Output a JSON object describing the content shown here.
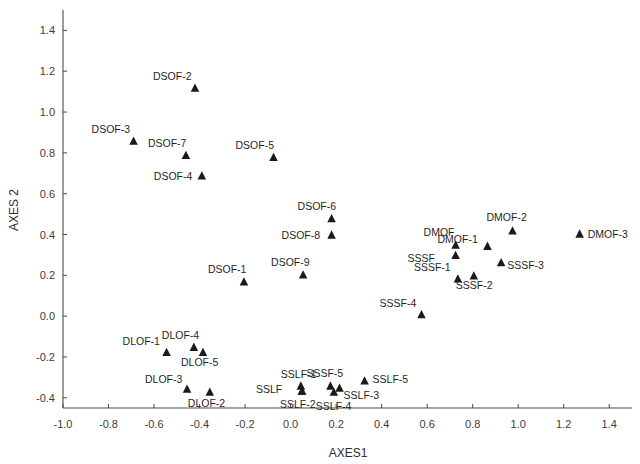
{
  "chart_data": {
    "type": "scatter",
    "title": "",
    "xlabel": "AXES1",
    "ylabel": "AXES 2",
    "xlim": [
      -1.0,
      1.5
    ],
    "ylim": [
      -0.45,
      1.5
    ],
    "grid": false,
    "legend": null,
    "marker": "triangle",
    "marker_color": "#1a1a1a",
    "xticks": [
      "-1.0",
      "-0.8",
      "-0.6",
      "-0.4",
      "-0.2",
      "0.0",
      "0.2",
      "0.4",
      "0.6",
      "0.8",
      "1.0",
      "1.2",
      "1.4"
    ],
    "xtick_values": [
      -1.0,
      -0.8,
      -0.6,
      -0.4,
      -0.2,
      0.0,
      0.2,
      0.4,
      0.6,
      0.8,
      1.0,
      1.2,
      1.4
    ],
    "yticks": [
      "-0.4",
      "-0.2",
      "0.0",
      "0.2",
      "0.4",
      "0.6",
      "0.8",
      "1.0",
      "1.2",
      "1.4"
    ],
    "ytick_values": [
      -0.4,
      -0.2,
      0.0,
      0.2,
      0.4,
      0.6,
      0.8,
      1.0,
      1.2,
      1.4
    ],
    "points": [
      {
        "label": "DSOF-2",
        "x": -0.42,
        "y": 1.115,
        "label_dx": -42,
        "label_dy": -9
      },
      {
        "label": "DSOF-3",
        "x": -0.69,
        "y": 0.855,
        "label_dx": -42,
        "label_dy": -9
      },
      {
        "label": "DSOF-7",
        "x": -0.46,
        "y": 0.785,
        "label_dx": -38,
        "label_dy": -9
      },
      {
        "label": "DSOF-5",
        "x": -0.075,
        "y": 0.775,
        "label_dx": -38,
        "label_dy": -9
      },
      {
        "label": "DSOF-4",
        "x": -0.39,
        "y": 0.685,
        "label_dx": -48,
        "label_dy": 4
      },
      {
        "label": "DSOF-6",
        "x": 0.18,
        "y": 0.475,
        "label_dx": -34,
        "label_dy": -9
      },
      {
        "label": "DSOF-8",
        "x": 0.18,
        "y": 0.395,
        "label_dx": -50,
        "label_dy": 3
      },
      {
        "label": "DSOF-9",
        "x": 0.055,
        "y": 0.2,
        "label_dx": -32,
        "label_dy": -9
      },
      {
        "label": "DSOF-1",
        "x": -0.205,
        "y": 0.165,
        "label_dx": -36,
        "label_dy": -9
      },
      {
        "label": "DMOF",
        "x": 0.725,
        "y": 0.345,
        "label_dx": -32,
        "label_dy": -10
      },
      {
        "label": "DMOF-1",
        "x": 0.865,
        "y": 0.34,
        "label_dx": -50,
        "label_dy": -4
      },
      {
        "label": "DMOF-2",
        "x": 0.975,
        "y": 0.415,
        "label_dx": -26,
        "label_dy": -10
      },
      {
        "label": "DMOF-3",
        "x": 1.27,
        "y": 0.4,
        "label_dx": 8,
        "label_dy": 3
      },
      {
        "label": "SSSF",
        "x": 0.725,
        "y": 0.295,
        "label_dx": -48,
        "label_dy": 6
      },
      {
        "label": "SSSF-3",
        "x": 0.925,
        "y": 0.26,
        "label_dx": 6,
        "label_dy": 6
      },
      {
        "label": "SSSF-1",
        "x": 0.735,
        "y": 0.18,
        "label_dx": -44,
        "label_dy": -8
      },
      {
        "label": "SSSF-2",
        "x": 0.805,
        "y": 0.195,
        "label_dx": -18,
        "label_dy": 13
      },
      {
        "label": "SSSF-4",
        "x": 0.575,
        "y": 0.005,
        "label_dx": -42,
        "label_dy": -8
      },
      {
        "label": "DLOF-4",
        "x": -0.425,
        "y": -0.155,
        "label_dx": -32,
        "label_dy": -9
      },
      {
        "label": "DLOF-1",
        "x": -0.545,
        "y": -0.18,
        "label_dx": -44,
        "label_dy": -8
      },
      {
        "label": "DLOF-5",
        "x": -0.385,
        "y": -0.18,
        "label_dx": -22,
        "label_dy": 13
      },
      {
        "label": "DLOF-3",
        "x": -0.455,
        "y": -0.36,
        "label_dx": -42,
        "label_dy": -7
      },
      {
        "label": "DLOF-2",
        "x": -0.355,
        "y": -0.375,
        "label_dx": -22,
        "label_dy": 14
      },
      {
        "label": "SSLF-1",
        "x": 0.045,
        "y": -0.345,
        "label_dx": -20,
        "label_dy": -9
      },
      {
        "label": "SSLF",
        "x": 0.05,
        "y": -0.37,
        "label_dx": -46,
        "label_dy": 1
      },
      {
        "label": "SSLF-2",
        "x": 0.05,
        "y": -0.37,
        "label_dx": -22,
        "label_dy": 16
      },
      {
        "label": "SSSF-5",
        "x": 0.175,
        "y": -0.345,
        "label_dx": -24,
        "label_dy": -10
      },
      {
        "label": "SSLF-3",
        "x": 0.215,
        "y": -0.355,
        "label_dx": 4,
        "label_dy": 10
      },
      {
        "label": "SSLF-4",
        "x": 0.19,
        "y": -0.375,
        "label_dx": -18,
        "label_dy": 17
      },
      {
        "label": "SSLF-5",
        "x": 0.325,
        "y": -0.32,
        "label_dx": 8,
        "label_dy": 2
      }
    ]
  },
  "axes": {
    "x_title": "AXES1",
    "y_title": "AXES 2"
  }
}
